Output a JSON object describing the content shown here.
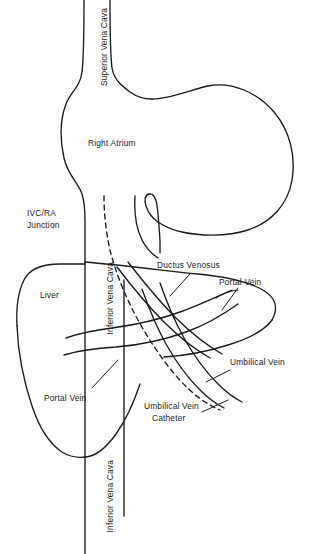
{
  "figure": {
    "type": "medical-anatomy-line-diagram",
    "background_color": "#ffffff",
    "line_color": "#1a1a1a"
  },
  "labels": {
    "superior_vena_cava": "Superior Vena Cava",
    "right_atrium": "Right Atrium",
    "ivc_ra_junction_line1": "IVC/RA",
    "ivc_ra_junction_line2": "Junction",
    "liver": "Liver",
    "inferior_vena_cava_upper": "Inferior Vena Cava",
    "inferior_vena_cava_lower": "Inferior Vena Cava",
    "ductus_venosus": "Ductus Venosus",
    "portal_vein_right": "Portal Vein",
    "portal_vein_left": "Portal Vein",
    "umbilical_vein": "Umbilical Vein",
    "umbilical_vein_catheter_line1": "Umbilical Vein",
    "umbilical_vein_catheter_line2": "Catheter"
  },
  "structures": [
    {
      "name": "superior-vena-cava",
      "style": "solid-outline"
    },
    {
      "name": "right-atrium",
      "style": "solid-outline"
    },
    {
      "name": "ivc-ra-junction",
      "style": "solid-outline"
    },
    {
      "name": "inferior-vena-cava",
      "style": "solid-outline"
    },
    {
      "name": "liver",
      "style": "solid-outline"
    },
    {
      "name": "ductus-venosus",
      "style": "solid-outline"
    },
    {
      "name": "portal-vein",
      "style": "solid-outline"
    },
    {
      "name": "umbilical-vein",
      "style": "solid-outline"
    },
    {
      "name": "umbilical-vein-catheter",
      "style": "dashed-line"
    }
  ]
}
